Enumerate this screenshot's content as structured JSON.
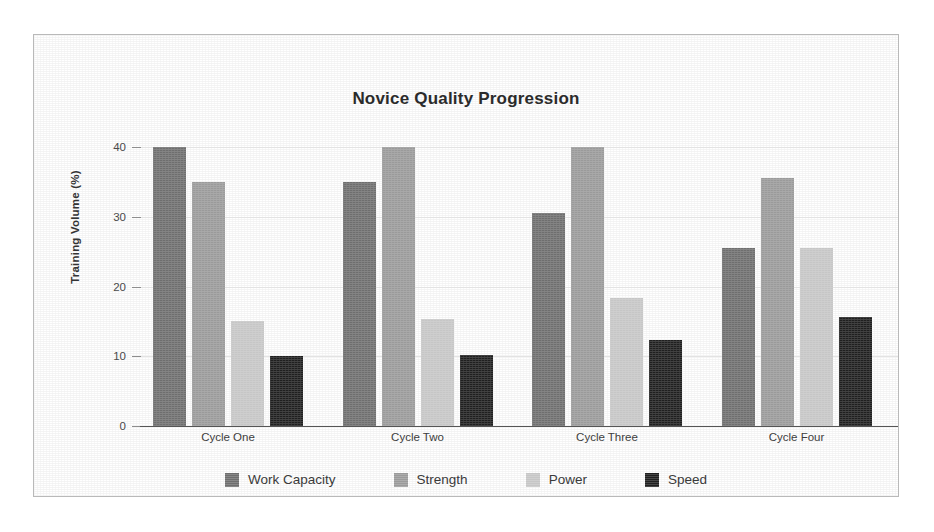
{
  "frame": {
    "border_color": "#b9b9b9"
  },
  "chart_data": {
    "type": "bar",
    "title": "Novice Quality Progression",
    "xlabel": "",
    "ylabel": "Training Volume (%)",
    "ylim": [
      0,
      40
    ],
    "yticks": [
      0,
      10,
      20,
      30,
      40
    ],
    "ytick_labels": [
      "0",
      "10",
      "20",
      "30",
      "40"
    ],
    "grid": true,
    "legend_position": "bottom",
    "categories": [
      "Cycle One",
      "Cycle Two",
      "Cycle Three",
      "Cycle Four"
    ],
    "series": [
      {
        "name": "Work Capacity",
        "color": "#6e6e6e",
        "values": [
          40,
          35,
          30.5,
          25.5
        ]
      },
      {
        "name": "Strength",
        "color": "#9a9a9a",
        "values": [
          35,
          40,
          40,
          35.5
        ]
      },
      {
        "name": "Power",
        "color": "#c6c6c6",
        "values": [
          15,
          15.3,
          18.4,
          25.5
        ]
      },
      {
        "name": "Speed",
        "color": "#1f1f1f",
        "values": [
          10.1,
          10.2,
          12.4,
          15.6
        ]
      }
    ]
  }
}
